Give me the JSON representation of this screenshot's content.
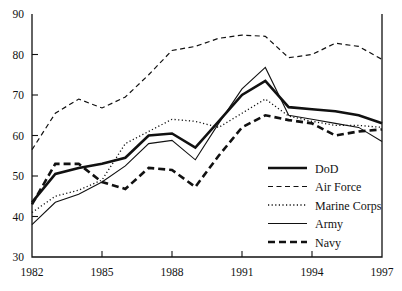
{
  "chart_data": {
    "type": "line",
    "title": "",
    "subtitle": "",
    "xlabel": "",
    "ylabel": "",
    "xlim": [
      1982,
      1997
    ],
    "ylim": [
      30,
      90
    ],
    "grid": false,
    "legend_position": "inside-right-lower",
    "x": [
      1982,
      1983,
      1984,
      1985,
      1986,
      1987,
      1988,
      1989,
      1990,
      1991,
      1992,
      1993,
      1994,
      1995,
      1996,
      1997
    ],
    "xticks": [
      1982,
      1985,
      1988,
      1991,
      1994,
      1997
    ],
    "xtick_labels": [
      "1982",
      "1985",
      "1988",
      "1991",
      "1994",
      "1997"
    ],
    "yticks": [
      30,
      40,
      50,
      60,
      70,
      80,
      90
    ],
    "ytick_labels": [
      "30",
      "40",
      "50",
      "60",
      "70",
      "80",
      "90"
    ],
    "series": [
      {
        "name": "DoD",
        "style": "solid-thick",
        "color": "#111111",
        "width": 2.6,
        "dash": "none",
        "values": [
          43.5,
          50.5,
          52.0,
          53.0,
          54.5,
          60.0,
          60.5,
          57.0,
          63.5,
          70.0,
          73.5,
          67.0,
          66.5,
          66.0,
          65.0,
          63.0
        ]
      },
      {
        "name": "Air Force",
        "style": "dashed-thin",
        "color": "#111111",
        "width": 1.2,
        "dash": "5,3.5",
        "values": [
          56.5,
          65.5,
          69.0,
          66.8,
          69.5,
          75.0,
          81.0,
          82.0,
          84.0,
          84.8,
          84.5,
          79.2,
          80.0,
          82.8,
          82.0,
          78.8
        ]
      },
      {
        "name": "Marine Corps",
        "style": "dotted",
        "color": "#111111",
        "width": 1.3,
        "dash": "1.2,2.4",
        "values": [
          41.0,
          45.0,
          46.5,
          49.0,
          58.0,
          61.0,
          64.0,
          63.5,
          62.0,
          65.5,
          69.0,
          64.8,
          63.5,
          62.5,
          62.5,
          62.0
        ]
      },
      {
        "name": "Army",
        "style": "solid-thin",
        "color": "#111111",
        "width": 1.1,
        "dash": "none",
        "values": [
          38.0,
          43.5,
          45.5,
          48.5,
          52.5,
          58.0,
          58.8,
          54.0,
          63.0,
          71.5,
          76.8,
          65.0,
          64.0,
          63.0,
          62.0,
          58.5
        ]
      },
      {
        "name": "Navy",
        "style": "dashed-thick",
        "color": "#111111",
        "width": 2.6,
        "dash": "7,4",
        "values": [
          43.0,
          53.0,
          53.0,
          48.5,
          46.8,
          52.0,
          51.5,
          47.3,
          55.0,
          62.0,
          65.0,
          63.8,
          63.0,
          60.0,
          61.0,
          61.5
        ]
      }
    ]
  },
  "legend": {
    "entries": [
      {
        "label": "DoD"
      },
      {
        "label": "Air Force"
      },
      {
        "label": "Marine Corps"
      },
      {
        "label": "Army"
      },
      {
        "label": "Navy"
      }
    ]
  }
}
